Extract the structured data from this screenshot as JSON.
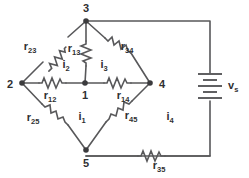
{
  "diagram": {
    "type": "electrical-circuit-schematic",
    "colors": {
      "wire": "#58585a",
      "text": "#2f2f31",
      "background": "#ffffff",
      "node": "#3b3b3d"
    },
    "nodes": [
      {
        "id": "node-1",
        "label": "1",
        "x": 85,
        "y": 83,
        "label_x": 85,
        "label_y": 99
      },
      {
        "id": "node-2",
        "label": "2",
        "x": 22,
        "y": 83,
        "label_x": 10,
        "label_y": 88
      },
      {
        "id": "node-3",
        "label": "3",
        "x": 86,
        "y": 21,
        "label_x": 86,
        "label_y": 12
      },
      {
        "id": "node-4",
        "label": "4",
        "x": 150,
        "y": 83,
        "label_x": 162,
        "label_y": 88
      },
      {
        "id": "node-5",
        "label": "5",
        "x": 86,
        "y": 150,
        "label_x": 86,
        "label_y": 167
      }
    ],
    "resistors": [
      {
        "id": "r23",
        "base": "r",
        "sub": "23",
        "between": [
          "2",
          "3"
        ],
        "label_x": 30,
        "label_y": 50
      },
      {
        "id": "r13",
        "base": "r",
        "sub": "13",
        "between": [
          "1",
          "3"
        ],
        "label_x": 74,
        "label_y": 52
      },
      {
        "id": "r34",
        "base": "r",
        "sub": "34",
        "between": [
          "3",
          "4"
        ],
        "label_x": 127,
        "label_y": 50
      },
      {
        "id": "r12",
        "base": "r",
        "sub": "12",
        "between": [
          "1",
          "2"
        ],
        "label_x": 50,
        "label_y": 99
      },
      {
        "id": "r14",
        "base": "r",
        "sub": "14",
        "between": [
          "1",
          "4"
        ],
        "label_x": 123,
        "label_y": 99
      },
      {
        "id": "r25",
        "base": "r",
        "sub": "25",
        "between": [
          "2",
          "5"
        ],
        "label_x": 33,
        "label_y": 121
      },
      {
        "id": "r45",
        "base": "r",
        "sub": "45",
        "between": [
          "4",
          "5"
        ],
        "label_x": 131,
        "label_y": 119
      },
      {
        "id": "r35",
        "base": "r",
        "sub": "35",
        "between": [
          "3",
          "5"
        ],
        "label_x": 159,
        "label_y": 168
      }
    ],
    "sources": [
      {
        "id": "vs",
        "base": "v",
        "sub": "s",
        "type": "battery",
        "label_x": 222,
        "label_y": 87
      }
    ],
    "mesh_currents": [
      {
        "id": "i1",
        "base": "i",
        "sub": "1",
        "label_x": 82,
        "label_y": 121
      },
      {
        "id": "i2",
        "base": "i",
        "sub": "2",
        "label_x": 66,
        "label_y": 69
      },
      {
        "id": "i3",
        "base": "i",
        "sub": "3",
        "label_x": 104,
        "label_y": 69
      },
      {
        "id": "i4",
        "base": "i",
        "sub": "4",
        "label_x": 170,
        "label_y": 121
      }
    ]
  }
}
